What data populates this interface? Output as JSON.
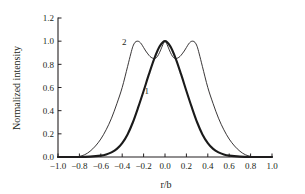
{
  "chart_data": {
    "type": "line",
    "title": "",
    "xlabel": "r/b",
    "ylabel": "Normalized intensity",
    "xlim": [
      -1.0,
      1.0
    ],
    "ylim": [
      0.0,
      1.2
    ],
    "grid": false,
    "legend_position": "inline-annotation",
    "xticks": [
      "−1.0",
      "−0.8",
      "−0.6",
      "−0.4",
      "−0.2",
      "0.0",
      "0.2",
      "0.4",
      "0.6",
      "0.8",
      "1.0"
    ],
    "xtick_values": [
      -1.0,
      -0.8,
      -0.6,
      -0.4,
      -0.2,
      0.0,
      0.2,
      0.4,
      0.6,
      0.8,
      1.0
    ],
    "yticks": [
      "0.0",
      "0.2",
      "0.4",
      "0.6",
      "0.8",
      "1.0",
      "1.2"
    ],
    "ytick_values": [
      0.0,
      0.2,
      0.4,
      0.6,
      0.8,
      1.0,
      1.2
    ],
    "annotations": [
      {
        "text": "1",
        "x": -0.17,
        "y": 0.545
      },
      {
        "text": "2",
        "x": -0.38,
        "y": 0.965
      }
    ],
    "series": [
      {
        "name": "1",
        "style": "thick",
        "color": "#1a1a1a",
        "description": "single-peak Gaussian centred at r/b = 0",
        "x": [
          -1.0,
          -0.9,
          -0.8,
          -0.7,
          -0.6,
          -0.55,
          -0.5,
          -0.45,
          -0.4,
          -0.35,
          -0.3,
          -0.25,
          -0.2,
          -0.15,
          -0.1,
          -0.05,
          0.0,
          0.05,
          0.1,
          0.15,
          0.2,
          0.25,
          0.3,
          0.35,
          0.4,
          0.45,
          0.5,
          0.55,
          0.6,
          0.7,
          0.8,
          0.9,
          1.0
        ],
        "y": [
          0.0,
          0.0,
          0.0,
          0.003,
          0.012,
          0.022,
          0.04,
          0.07,
          0.12,
          0.195,
          0.3,
          0.43,
          0.57,
          0.715,
          0.85,
          0.955,
          1.0,
          0.955,
          0.85,
          0.715,
          0.57,
          0.43,
          0.3,
          0.195,
          0.12,
          0.07,
          0.04,
          0.022,
          0.012,
          0.003,
          0.0,
          0.0,
          0.0
        ]
      },
      {
        "name": "2",
        "style": "thin",
        "color": "#231f20",
        "description": "triple-peak profile: side lobes at r/b = ±0.28 and central peak at 0, dips to 0.85",
        "x": [
          -1.0,
          -0.9,
          -0.85,
          -0.8,
          -0.75,
          -0.7,
          -0.65,
          -0.6,
          -0.55,
          -0.5,
          -0.45,
          -0.4,
          -0.35,
          -0.32,
          -0.3,
          -0.28,
          -0.26,
          -0.24,
          -0.22,
          -0.2,
          -0.18,
          -0.16,
          -0.14,
          -0.12,
          -0.1,
          -0.08,
          -0.06,
          -0.04,
          -0.02,
          0.0,
          0.02,
          0.04,
          0.06,
          0.08,
          0.1,
          0.12,
          0.14,
          0.16,
          0.18,
          0.2,
          0.22,
          0.24,
          0.26,
          0.28,
          0.3,
          0.32,
          0.35,
          0.4,
          0.45,
          0.5,
          0.55,
          0.6,
          0.65,
          0.7,
          0.75,
          0.8,
          0.85,
          0.9,
          1.0
        ],
        "y": [
          0.0,
          0.0,
          0.0,
          0.005,
          0.02,
          0.05,
          0.095,
          0.155,
          0.235,
          0.335,
          0.46,
          0.6,
          0.78,
          0.89,
          0.955,
          0.99,
          1.0,
          0.995,
          0.975,
          0.945,
          0.915,
          0.89,
          0.868,
          0.855,
          0.85,
          0.858,
          0.885,
          0.925,
          0.97,
          1.0,
          0.97,
          0.925,
          0.885,
          0.858,
          0.85,
          0.855,
          0.868,
          0.89,
          0.915,
          0.945,
          0.975,
          0.995,
          1.0,
          0.99,
          0.955,
          0.89,
          0.78,
          0.6,
          0.46,
          0.335,
          0.235,
          0.155,
          0.095,
          0.05,
          0.02,
          0.005,
          0.0,
          0.0,
          0.0
        ]
      }
    ]
  }
}
